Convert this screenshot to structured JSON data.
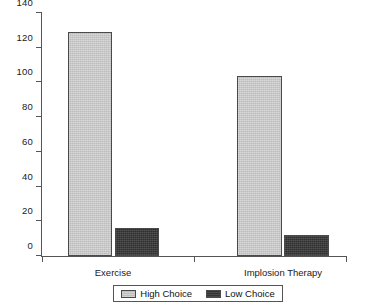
{
  "chart_data": {
    "type": "bar",
    "title": "",
    "subtitle": "",
    "xlabel": "",
    "ylabel": "",
    "categories": [
      "Exercise",
      "Implosion Therapy"
    ],
    "series": [
      {
        "name": "High Choice",
        "color": "#c3c3c3",
        "values": [
          129,
          104
        ]
      },
      {
        "name": "Low Choice",
        "color": "#3a3a3a",
        "values": [
          16,
          12
        ]
      }
    ],
    "ylim": [
      0,
      140
    ],
    "ytick_step": 20,
    "ytick_labels": [
      "0",
      "20",
      "40",
      "60",
      "80",
      "100",
      "120",
      "140"
    ],
    "ytick_values": [
      0,
      20,
      40,
      60,
      80,
      100,
      120,
      140
    ],
    "grid": false,
    "legend_position": "bottom-center",
    "legend_entries": [
      "High Choice",
      "Low Choice"
    ],
    "axis_color": "#555555"
  },
  "legend": {
    "entries": [
      {
        "label": "High Choice",
        "swatch": "high"
      },
      {
        "label": "Low Choice",
        "swatch": "low"
      }
    ]
  }
}
